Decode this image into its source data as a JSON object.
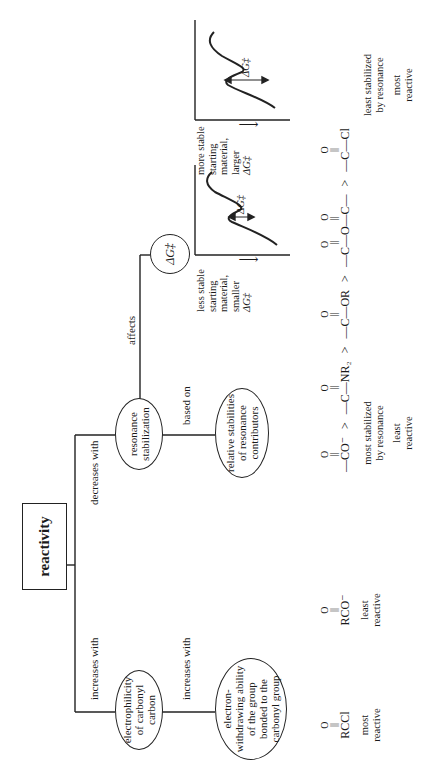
{
  "root": {
    "label": "reactivity"
  },
  "branches": {
    "left_edge_label": "increases with",
    "right_edge_label": "decreases with"
  },
  "nodes": {
    "electrophilicity": "electrophilicity of carbonyl carbon",
    "electrophilicity_edge": "increases with",
    "electron_withdrawing": "electron-withdrawing ability of the group bonded to the carbonyl group",
    "resonance": "resonance stabilization",
    "resonance_based_edge": "based on",
    "relative_stabilities": "relative stabilities of resonance contributors",
    "affects_edge": "affects",
    "delta_g": "ΔG‡"
  },
  "left_series": {
    "compounds": [
      {
        "top": "O",
        "formula": "RCCl",
        "caption_1": "most",
        "caption_2": "reactive"
      },
      {
        "top": "O",
        "formula": "RCO⁻",
        "caption_1": "least",
        "caption_2": "reactive"
      }
    ]
  },
  "right_series": {
    "compounds": [
      "—CO⁻",
      "—C—NR₂",
      "—C—OR",
      "—C—O—C—",
      "—C—Cl"
    ],
    "separator": ">",
    "carbonyl_top": "O",
    "left_caption": [
      "most stabilized",
      "by resonance"
    ],
    "left_reactivity": [
      "least",
      "reactive"
    ],
    "right_caption": [
      "least stabilized",
      "by resonance"
    ],
    "right_reactivity": [
      "most",
      "reactive"
    ]
  },
  "energy_diagrams": [
    {
      "caption": [
        "less stable",
        "starting",
        "material,",
        "smaller",
        "ΔG‡"
      ],
      "arrow": "⟶",
      "barrier_label": "ΔG‡"
    },
    {
      "caption": [
        "more stable",
        "starting",
        "material,",
        "larger",
        "ΔG‡"
      ],
      "arrow": "⟶",
      "barrier_label": "ΔG‡"
    }
  ]
}
